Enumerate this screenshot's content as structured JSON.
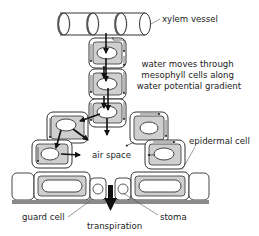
{
  "diagram": {
    "labels": {
      "xylem": "xylem vessel",
      "water_line1": "water moves through",
      "water_line2": "mesophyll cells along",
      "water_line3": "water potential gradient",
      "epidermal": "epidermal cell",
      "air_space": "air space",
      "guard_cell": "guard cell",
      "stoma": "stoma",
      "transpiration": "transpiration"
    },
    "colors": {
      "cytoplasm": "#cfcfcf",
      "cuticle": "#8a8a8a",
      "outline": "#333333",
      "arrow": "#111111"
    }
  }
}
